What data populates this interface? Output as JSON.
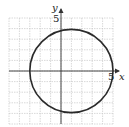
{
  "chart_data": {
    "type": "line",
    "title": "",
    "xlabel": "x",
    "ylabel": "y",
    "xlim": [
      -5,
      5
    ],
    "ylim": [
      -5,
      5
    ],
    "grid": true,
    "grid_step": 1,
    "tick_labels": {
      "x": [
        "5"
      ],
      "y": [
        "5"
      ]
    },
    "series": [
      {
        "name": "circle",
        "shape": "circle",
        "center": [
          1,
          0
        ],
        "radius": 4,
        "points": [
          [
            5,
            0
          ],
          [
            1,
            4
          ],
          [
            -3,
            0
          ],
          [
            1,
            -4
          ]
        ]
      }
    ]
  },
  "labels": {
    "x_axis": "x",
    "y_axis": "y",
    "x_tick": "5",
    "y_tick": "5"
  },
  "colors": {
    "grid": "#c8c8c8",
    "axis": "#333333",
    "curve": "#2a2a2a"
  }
}
